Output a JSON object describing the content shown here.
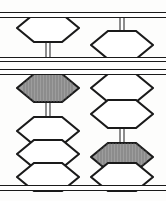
{
  "figure": {
    "name": "abacus",
    "width": 166,
    "height": 201
  },
  "colors": {
    "ink": "#1a1a1a",
    "bead_white": "#ffffff",
    "bead_shaded": "#9d9d9d",
    "hatch": "#6e6e6e",
    "background": "#fdfdfc"
  },
  "frame": {
    "bars": [
      {
        "label": "top-rail",
        "y": 12,
        "height": 6
      },
      {
        "label": "upper-reckoning-rail",
        "y": 57,
        "height": 5
      },
      {
        "label": "lower-reckoning-rail",
        "y": 69,
        "height": 6
      },
      {
        "label": "bottom-rail",
        "y": 185,
        "height": 6
      }
    ]
  },
  "rods": [
    {
      "name": "rod-left",
      "index": 1,
      "x": 48,
      "upper_deck": {
        "beads": [
          {
            "name": "upper-bead",
            "state": "up",
            "fill": "white",
            "value": 5,
            "active": true
          }
        ],
        "wire_segments": [
          {
            "name": "wire-below-upper-bead",
            "top": 40,
            "bottom": 58
          }
        ]
      },
      "lower_deck": {
        "beads": [
          {
            "name": "lower-bead-1",
            "state": "up",
            "fill": "shaded",
            "value": 1,
            "active": true
          },
          {
            "name": "lower-bead-2",
            "state": "down",
            "fill": "white",
            "value": 1,
            "active": false
          },
          {
            "name": "lower-bead-3",
            "state": "down",
            "fill": "white",
            "value": 1,
            "active": false
          },
          {
            "name": "lower-bead-4",
            "state": "down",
            "fill": "white",
            "value": 1,
            "active": false
          }
        ],
        "wire_segments": [
          {
            "name": "wire-below-lower-bead-1",
            "top": 101,
            "bottom": 118
          }
        ]
      }
    },
    {
      "name": "rod-right",
      "index": 2,
      "x": 122,
      "upper_deck": {
        "beads": [
          {
            "name": "upper-bead",
            "state": "down",
            "fill": "white",
            "value": 5,
            "active": false
          }
        ],
        "wire_segments": [
          {
            "name": "wire-above-upper-bead",
            "top": 15,
            "bottom": 31
          }
        ]
      },
      "lower_deck": {
        "beads": [
          {
            "name": "lower-bead-1",
            "state": "up",
            "fill": "white",
            "value": 1,
            "active": true
          },
          {
            "name": "lower-bead-2",
            "state": "up",
            "fill": "white",
            "value": 1,
            "active": true
          },
          {
            "name": "lower-bead-3",
            "state": "down",
            "fill": "shaded",
            "value": 1,
            "active": false
          },
          {
            "name": "lower-bead-4",
            "state": "down",
            "fill": "white",
            "value": 1,
            "active": false
          }
        ],
        "wire_segments": [
          {
            "name": "wire-below-lower-bead-2",
            "top": 128,
            "bottom": 145
          }
        ]
      }
    }
  ],
  "bead_geometry": {
    "width": 64,
    "height": 30,
    "shoulder_inset": 18,
    "flat_top_ratio": 0.38
  },
  "hatching": {
    "enabled": true,
    "orientation": "vertical",
    "spacing": 3
  }
}
